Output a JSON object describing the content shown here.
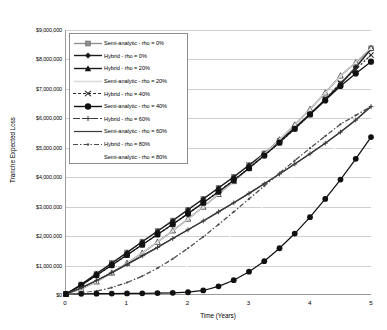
{
  "chart_data": {
    "type": "line",
    "title": "",
    "xlabel": "Time (Years)",
    "ylabel": "Tranche Expected Loss",
    "xlim": [
      0,
      5
    ],
    "ylim": [
      0,
      9000000
    ],
    "xticks": [
      "0",
      "1",
      "2",
      "3",
      "4",
      "5"
    ],
    "xtick_values": [
      0,
      1,
      2,
      3,
      4,
      5
    ],
    "yticks": [
      "$0",
      "$1,000,000",
      "$2,000,000",
      "$3,000,000",
      "$4,000,000",
      "$5,000,000",
      "$6,000,000",
      "$7,000,000",
      "$8,000,000",
      "$9,000,000"
    ],
    "ytick_values": [
      0,
      1000000,
      2000000,
      3000000,
      4000000,
      5000000,
      6000000,
      7000000,
      8000000,
      9000000
    ],
    "grid": "horizontal",
    "legend_position": "upper-left-inside",
    "x": [
      0,
      0.25,
      0.5,
      0.75,
      1,
      1.25,
      1.5,
      1.75,
      2,
      2.25,
      2.5,
      2.75,
      3,
      3.25,
      3.5,
      3.75,
      4,
      4.25,
      4.5,
      4.75,
      5
    ],
    "series": [
      {
        "name": "Semi-analytic - rho = 0%",
        "marker": "square",
        "color": "#8c8c8c",
        "linestyle": "solid",
        "values": [
          0,
          330000,
          700000,
          1060000,
          1420000,
          1790000,
          2150000,
          2510000,
          2880000,
          3250000,
          3620000,
          4000000,
          4400000,
          4800000,
          5230000,
          5680000,
          6150000,
          6650000,
          7180000,
          7760000,
          8380000
        ]
      },
      {
        "name": "Hybrid - rho = 0%",
        "marker": "diamond",
        "color": "#1a1a1a",
        "linestyle": "solid",
        "values": [
          0,
          320000,
          690000,
          1050000,
          1410000,
          1780000,
          2140000,
          2500000,
          2870000,
          3240000,
          3610000,
          3990000,
          4390000,
          4790000,
          5220000,
          5660000,
          6130000,
          6620000,
          7150000,
          7720000,
          8350000
        ]
      },
      {
        "name": "Hybrid - rho = 20%",
        "marker": "triangle",
        "color": "#1a1a1a",
        "linestyle": "solid",
        "values": [
          0,
          170000,
          420000,
          720000,
          1050000,
          1400000,
          1770000,
          2160000,
          2560000,
          2970000,
          3400000,
          3840000,
          4300000,
          4770000,
          5260000,
          5770000,
          6300000,
          6860000,
          7440000,
          7890000,
          8380000
        ]
      },
      {
        "name": "Semi-analytic - rho = 20%",
        "marker": "none",
        "color": "#d8d8d8",
        "linestyle": "solid",
        "values": [
          0,
          170000,
          420000,
          720000,
          1050000,
          1400000,
          1770000,
          2160000,
          2560000,
          2970000,
          3400000,
          3840000,
          4300000,
          4770000,
          5260000,
          5770000,
          6300000,
          6860000,
          7440000,
          7900000,
          8390000
        ]
      },
      {
        "name": "Hybrid - rho = 40%",
        "marker": "x",
        "color": "#2a2a2a",
        "linestyle": "dotted",
        "values": [
          0,
          300000,
          640000,
          980000,
          1330000,
          1680000,
          2030000,
          2380000,
          2740000,
          3110000,
          3490000,
          3880000,
          4290000,
          4720000,
          5160000,
          5630000,
          6120000,
          6640000,
          7190000,
          7660000,
          8150000
        ]
      },
      {
        "name": "Semi-analytic - rho = 40%",
        "marker": "circle",
        "color": "#111111",
        "linestyle": "solid",
        "values": [
          0,
          300000,
          640000,
          980000,
          1330000,
          1680000,
          2030000,
          2380000,
          2740000,
          3110000,
          3490000,
          3880000,
          4290000,
          4720000,
          5160000,
          5630000,
          6120000,
          6600000,
          7090000,
          7520000,
          7920000
        ]
      },
      {
        "name": "Hybrid - rho = 60%",
        "marker": "plus",
        "color": "#3a3a3a",
        "linestyle": "solid",
        "values": [
          0,
          210000,
          460000,
          730000,
          1010000,
          1300000,
          1590000,
          1890000,
          2190000,
          2490000,
          2800000,
          3110000,
          3430000,
          3760000,
          4090000,
          4430000,
          4780000,
          5140000,
          5520000,
          5930000,
          6390000
        ]
      },
      {
        "name": "Semi-analytic - rho = 60%",
        "marker": "none",
        "color": "#3a3a3a",
        "linestyle": "solid",
        "values": [
          0,
          210000,
          460000,
          730000,
          1010000,
          1300000,
          1590000,
          1890000,
          2190000,
          2490000,
          2800000,
          3110000,
          3430000,
          3760000,
          4090000,
          4430000,
          4780000,
          5140000,
          5520000,
          5930000,
          6390000
        ]
      },
      {
        "name": "Hybrid - rho = 80%",
        "marker": "dot",
        "color": "#4a4a4a",
        "linestyle": "dashdot",
        "values": [
          0,
          30000,
          100000,
          220000,
          390000,
          610000,
          880000,
          1200000,
          1560000,
          1950000,
          2370000,
          2800000,
          3240000,
          3680000,
          4120000,
          4550000,
          4970000,
          5380000,
          5790000,
          6090000,
          6390000
        ]
      },
      {
        "name": "Semi-analytic - rho = 80%",
        "marker": "none",
        "color": "#ffffff",
        "linestyle": "solid",
        "values": [
          0,
          20000,
          60000,
          120000,
          210000,
          330000,
          490000,
          700000,
          960000,
          1280000,
          1650000,
          2070000,
          2530000,
          3020000,
          3530000,
          4050000,
          4560000,
          4820000,
          5040000,
          5210000,
          5350000
        ]
      },
      {
        "name": "Hybrid - rho = 80% (tranche)",
        "marker": "hexagon",
        "color": "#101010",
        "linestyle": "solid",
        "hidden_from_legend": true,
        "values": [
          0,
          5000,
          10000,
          15000,
          20000,
          25000,
          30000,
          40000,
          60000,
          120000,
          260000,
          470000,
          760000,
          1120000,
          1560000,
          2060000,
          2620000,
          3240000,
          3900000,
          4610000,
          5350000
        ]
      }
    ]
  },
  "legend": {
    "items": [
      {
        "label": "Semi-analytic - rho = 0%",
        "key": "square"
      },
      {
        "label": "Hybrid - rho = 0%",
        "key": "diamond"
      },
      {
        "label": "Hybrid - rho = 20%",
        "key": "triangle"
      },
      {
        "label": "Semi-analytic - rho = 20%",
        "key": "lightline"
      },
      {
        "label": "Hybrid - rho = 40%",
        "key": "xdash"
      },
      {
        "label": "Semi-analytic - rho = 40%",
        "key": "circle"
      },
      {
        "label": "Hybrid - rho = 60%",
        "key": "plusdash"
      },
      {
        "label": "Semi-analytic - rho = 60%",
        "key": "line"
      },
      {
        "label": "Hybrid - rho = 80%",
        "key": "dashdot"
      },
      {
        "label": "Semi-analytic - rho = 80%",
        "key": "blank"
      }
    ]
  }
}
